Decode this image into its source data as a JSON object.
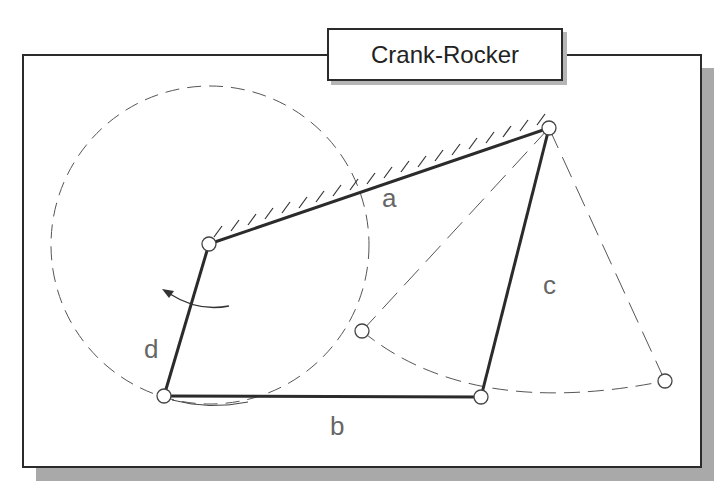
{
  "title": "Crank-Rocker",
  "labels": {
    "a": "a",
    "b": "b",
    "c": "c",
    "d": "d"
  },
  "joints": {
    "ground_left": [
      209,
      244
    ],
    "ground_right": [
      549,
      128
    ],
    "crank_tip": [
      164,
      396
    ],
    "rocker_tip": [
      481,
      397
    ],
    "rocker_extreme_left": [
      362,
      331
    ],
    "rocker_extreme_right": [
      665,
      381
    ]
  },
  "crank_circle": {
    "cx": 210,
    "cy": 245,
    "r": 159
  },
  "colors": {
    "link": "#2b2b2b",
    "dashed": "#555555",
    "label": "#666666",
    "shadow": "#a9a9a9"
  }
}
